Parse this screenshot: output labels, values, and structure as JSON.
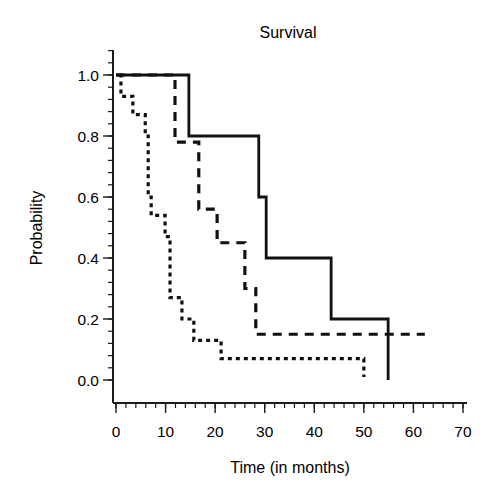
{
  "chart_data": {
    "type": "line",
    "subtype": "kaplan-meier step",
    "title": "Survival",
    "xlabel": "Time (in months)",
    "ylabel": "Probability",
    "xlim": [
      0,
      70
    ],
    "ylim": [
      0.0,
      1.0
    ],
    "x_ticks": [
      "0",
      "10",
      "20",
      "30",
      "40",
      "50",
      "60",
      "70"
    ],
    "y_ticks": [
      "0.0",
      "0.2",
      "0.4",
      "0.6",
      "0.8",
      "1.0"
    ],
    "grid": false,
    "legend": null,
    "series": [
      {
        "name": "solid",
        "style": "solid",
        "steps": [
          [
            0,
            1.0
          ],
          [
            14.7,
            0.8
          ],
          [
            28.8,
            0.6
          ],
          [
            30.3,
            0.4
          ],
          [
            43.4,
            0.2
          ],
          [
            54.9,
            0.0
          ]
        ],
        "end": 54.9
      },
      {
        "name": "dashed",
        "style": "dashed",
        "steps": [
          [
            0,
            1.0
          ],
          [
            11.9,
            0.78
          ],
          [
            16.7,
            0.56
          ],
          [
            20.4,
            0.45
          ],
          [
            26.0,
            0.3
          ],
          [
            28.2,
            0.15
          ]
        ],
        "end": 62.3
      },
      {
        "name": "dotted",
        "style": "dotted",
        "steps": [
          [
            0.7,
            1.0
          ],
          [
            1.0,
            0.93
          ],
          [
            3.4,
            0.87
          ],
          [
            5.9,
            0.8
          ],
          [
            6.5,
            0.6
          ],
          [
            7.1,
            0.54
          ],
          [
            9.9,
            0.47
          ],
          [
            10.9,
            0.27
          ],
          [
            13.3,
            0.2
          ],
          [
            15.7,
            0.13
          ],
          [
            21.2,
            0.07
          ],
          [
            50.0,
            0.01
          ]
        ],
        "end": 50.0
      }
    ]
  },
  "layout": {
    "x0_px": 116,
    "px_per_month": 4.957,
    "y0_px": 380,
    "px_per_unit": 305,
    "axis_left_px": 113,
    "axis_bottom_px": 403,
    "axis_top_px": 50,
    "axis_right_px": 467
  }
}
